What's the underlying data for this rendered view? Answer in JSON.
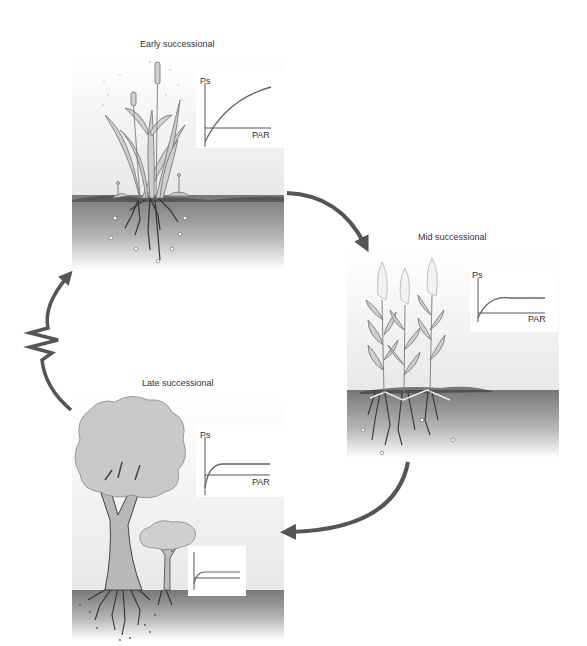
{
  "diagram": {
    "type": "succession-cycle",
    "stages": [
      {
        "id": "early",
        "title": "Early successional",
        "graph": {
          "y_label": "Ps",
          "x_label": "PAR",
          "curve": "slow-rising, high saturation"
        }
      },
      {
        "id": "mid",
        "title": "Mid successional",
        "graph": {
          "y_label": "Ps",
          "x_label": "PAR",
          "curve": "moderate rise, medium saturation"
        }
      },
      {
        "id": "late",
        "title": "Late successional",
        "graph": {
          "y_label": "Ps",
          "x_label": "PAR",
          "curve": "rapid rise, low saturation"
        },
        "inset_graph": {
          "curve": "rapid rise, low saturation (understory)"
        }
      }
    ],
    "arrows": [
      {
        "from": "early",
        "to": "mid",
        "style": "curved"
      },
      {
        "from": "mid",
        "to": "late",
        "style": "curved"
      },
      {
        "from": "late",
        "to": "early",
        "style": "zigzag-disturbance"
      }
    ],
    "colors": {
      "arrow": "#555555",
      "soil_top": "#7a7a7a",
      "soil_bottom": "#ffffff",
      "sky_top": "#ffffff",
      "sky_bottom": "#e6e6e6",
      "plant_fill": "#c8c8c8",
      "plant_stroke": "#777777",
      "curve": "#666666"
    }
  }
}
